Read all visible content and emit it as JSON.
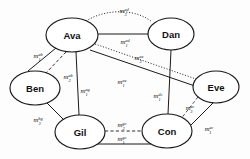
{
  "diagram": {
    "background_color": "#fdfdfd",
    "stroke_color": "#1a1a1a",
    "nodes": [
      {
        "id": "ava",
        "label": "Ava",
        "cx": 72,
        "cy": 35,
        "rx": 26,
        "ry": 17
      },
      {
        "id": "dan",
        "label": "Dan",
        "cx": 171,
        "cy": 34,
        "rx": 23,
        "ry": 16
      },
      {
        "id": "ben",
        "label": "Ben",
        "cx": 35,
        "cy": 88,
        "rx": 25,
        "ry": 17
      },
      {
        "id": "eve",
        "label": "Eve",
        "cx": 216,
        "cy": 87,
        "rx": 23,
        "ry": 16
      },
      {
        "id": "gil",
        "label": "Gil",
        "cx": 80,
        "cy": 132,
        "rx": 25,
        "ry": 17
      },
      {
        "id": "con",
        "label": "Con",
        "cx": 167,
        "cy": 131,
        "rx": 25,
        "ry": 17
      }
    ],
    "edges": [
      {
        "id": "ad3",
        "from": "ava",
        "to": "dan",
        "style": "dotted"
      },
      {
        "id": "ad1",
        "from": "ava",
        "to": "dan",
        "style": "solid"
      },
      {
        "id": "ab1",
        "from": "ava",
        "to": "ben",
        "style": "solid"
      },
      {
        "id": "ab2",
        "from": "ava",
        "to": "ben",
        "style": "dashed"
      },
      {
        "id": "ag1",
        "from": "ava",
        "to": "gil",
        "style": "solid"
      },
      {
        "id": "ae3",
        "from": "ava",
        "to": "eve",
        "style": "dotted"
      },
      {
        "id": "ae1",
        "from": "ava",
        "to": "eve",
        "style": "solid"
      },
      {
        "id": "dc1",
        "from": "dan",
        "to": "con",
        "style": "solid"
      },
      {
        "id": "ec3",
        "from": "eve",
        "to": "con",
        "style": "dashed"
      },
      {
        "id": "ec1",
        "from": "eve",
        "to": "con",
        "style": "solid"
      },
      {
        "id": "bg3",
        "from": "ben",
        "to": "gil",
        "style": "solid"
      },
      {
        "id": "gc2",
        "from": "gil",
        "to": "con",
        "style": "dashed"
      },
      {
        "id": "gc1",
        "from": "gil",
        "to": "con",
        "style": "solid"
      }
    ],
    "edge_labels": [
      {
        "id": "ad3",
        "base": "m",
        "sup": "ad",
        "sub": "3",
        "x": 124,
        "y": 13
      },
      {
        "id": "ad1",
        "base": "m",
        "sup": "ad",
        "sub": "1",
        "x": 125,
        "y": 44
      },
      {
        "id": "ab1",
        "base": "m",
        "sup": "ab",
        "sub": "1",
        "x": 38,
        "y": 58
      },
      {
        "id": "ab2",
        "base": "m",
        "sup": "ab",
        "sub": "2",
        "x": 68,
        "y": 79
      },
      {
        "id": "ag1",
        "base": "m",
        "sup": "ag",
        "sub": "1",
        "x": 85,
        "y": 93
      },
      {
        "id": "ae3",
        "base": "m",
        "sup": "ae",
        "sub": "3",
        "x": 139,
        "y": 60
      },
      {
        "id": "ae1",
        "base": "m",
        "sup": "ae",
        "sub": "1",
        "x": 122,
        "y": 84
      },
      {
        "id": "dc1",
        "base": "m",
        "sup": "dc",
        "sub": "1",
        "x": 158,
        "y": 98
      },
      {
        "id": "ec3",
        "base": "m",
        "sup": "ec",
        "sub": "3",
        "x": 190,
        "y": 110
      },
      {
        "id": "ec1",
        "base": "m",
        "sup": "ec",
        "sub": "1",
        "x": 209,
        "y": 131
      },
      {
        "id": "bg3",
        "base": "m",
        "sup": "bg",
        "sub": "3",
        "x": 38,
        "y": 122
      },
      {
        "id": "gc2",
        "base": "m",
        "sup": "gc",
        "sub": "2",
        "x": 122,
        "y": 127
      },
      {
        "id": "gc1",
        "base": "m",
        "sup": "gc",
        "sub": "1",
        "x": 122,
        "y": 141
      }
    ]
  }
}
